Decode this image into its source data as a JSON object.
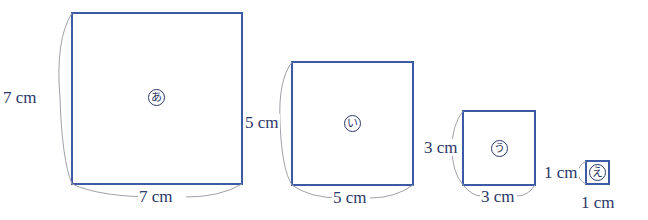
{
  "squares": [
    {
      "id": "a",
      "mark": "あ",
      "side_label_left": "7 cm",
      "side_label_bottom": "7 cm",
      "side_cm": 7
    },
    {
      "id": "i",
      "mark": "い",
      "side_label_left": "5 cm",
      "side_label_bottom": "5 cm",
      "side_cm": 5
    },
    {
      "id": "u",
      "mark": "う",
      "side_label_left": "3 cm",
      "side_label_bottom": "3 cm",
      "side_cm": 3
    },
    {
      "id": "e",
      "mark": "え",
      "side_label_left": "1 cm",
      "side_label_bottom": "1 cm",
      "side_cm": 1
    }
  ],
  "colors": {
    "square_stroke": "#3c5aa6",
    "label": "#2b3868",
    "brace": "#a0a0a8"
  }
}
